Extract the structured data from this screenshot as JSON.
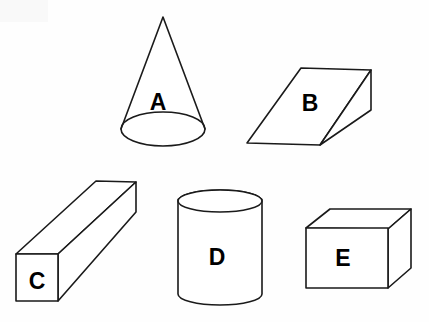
{
  "figure": {
    "background_color": "#ffffff",
    "stroke_color": "#1a1a1a",
    "label_color": "#000000",
    "width": 429,
    "height": 322,
    "shapes": [
      {
        "id": "A",
        "label": "A",
        "name": "cone",
        "label_x": 158,
        "label_y": 102
      },
      {
        "id": "B",
        "label": "B",
        "name": "oblique-wedge-prism",
        "label_x": 310,
        "label_y": 103
      },
      {
        "id": "C",
        "label": "C",
        "name": "long-rectangular-beam",
        "label_x": 37,
        "label_y": 281
      },
      {
        "id": "D",
        "label": "D",
        "name": "cylinder",
        "label_x": 217,
        "label_y": 257
      },
      {
        "id": "E",
        "label": "E",
        "name": "cuboid-box",
        "label_x": 343,
        "label_y": 258
      }
    ]
  }
}
